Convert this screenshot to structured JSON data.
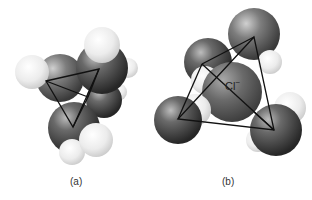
{
  "figure": {
    "panels": [
      {
        "id": "a",
        "label": "(a)",
        "description": "Space-filling cluster with tetrahedron outline"
      },
      {
        "id": "b",
        "label": "(b)",
        "description": "Chloride ion surrounded by four water molecules in tetrahedral arrangement",
        "center_ion_label": "Cl",
        "center_ion_charge": "−"
      }
    ],
    "colors": {
      "oxygen_dark": "#3a3a3a",
      "oxygen_mid": "#6e6e6e",
      "hydrogen_light": "#ececec",
      "chloride": "#5a5a5a",
      "outline": "#111111",
      "background": "#ffffff"
    }
  }
}
